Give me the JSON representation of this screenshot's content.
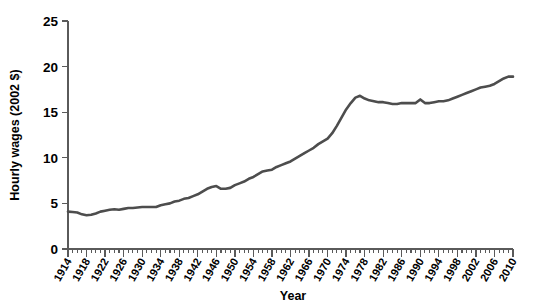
{
  "chart_data": {
    "type": "line",
    "title": "",
    "xlabel": "Year",
    "ylabel": "Hourly wages (2002 $)",
    "xlim": [
      1914,
      2010
    ],
    "ylim": [
      0,
      25
    ],
    "grid": false,
    "legend": null,
    "line_color": "#4d4d4d",
    "axis_color": "#5a5a5a",
    "y_ticks": [
      0,
      5,
      10,
      15,
      20,
      25
    ],
    "x_ticks": [
      1914,
      1918,
      1922,
      1926,
      1930,
      1934,
      1938,
      1942,
      1946,
      1950,
      1954,
      1958,
      1962,
      1966,
      1970,
      1974,
      1978,
      1982,
      1986,
      1990,
      1994,
      1998,
      2002,
      2006,
      2010
    ],
    "x_minor_step": 1,
    "series": [
      {
        "name": "Hourly wages (2002 $)",
        "x": [
          1914,
          1915,
          1916,
          1917,
          1918,
          1919,
          1920,
          1921,
          1922,
          1923,
          1924,
          1925,
          1926,
          1927,
          1928,
          1929,
          1930,
          1931,
          1932,
          1933,
          1934,
          1935,
          1936,
          1937,
          1938,
          1939,
          1940,
          1941,
          1942,
          1943,
          1944,
          1945,
          1946,
          1947,
          1948,
          1949,
          1950,
          1951,
          1952,
          1953,
          1954,
          1955,
          1956,
          1957,
          1958,
          1959,
          1960,
          1961,
          1962,
          1963,
          1964,
          1965,
          1966,
          1967,
          1968,
          1969,
          1970,
          1971,
          1972,
          1973,
          1974,
          1975,
          1976,
          1977,
          1978,
          1979,
          1980,
          1981,
          1982,
          1983,
          1984,
          1985,
          1986,
          1987,
          1988,
          1989,
          1990,
          1991,
          1992,
          1993,
          1994,
          1995,
          1996,
          1997,
          1998,
          1999,
          2000,
          2001,
          2002,
          2003,
          2004,
          2005,
          2006,
          2007,
          2008,
          2009,
          2010
        ],
        "y": [
          4.1,
          4.05,
          4.0,
          3.8,
          3.7,
          3.75,
          3.9,
          4.1,
          4.2,
          4.3,
          4.35,
          4.3,
          4.4,
          4.5,
          4.5,
          4.55,
          4.6,
          4.6,
          4.6,
          4.6,
          4.8,
          4.9,
          5.0,
          5.2,
          5.3,
          5.5,
          5.6,
          5.8,
          6.0,
          6.3,
          6.6,
          6.8,
          6.9,
          6.6,
          6.6,
          6.7,
          7.0,
          7.2,
          7.4,
          7.7,
          7.9,
          8.2,
          8.5,
          8.6,
          8.7,
          9.0,
          9.2,
          9.4,
          9.6,
          9.9,
          10.2,
          10.5,
          10.8,
          11.1,
          11.5,
          11.8,
          12.1,
          12.7,
          13.5,
          14.4,
          15.3,
          16.0,
          16.6,
          16.8,
          16.5,
          16.3,
          16.2,
          16.1,
          16.1,
          16.0,
          15.9,
          15.9,
          16.0,
          16.0,
          16.0,
          16.0,
          16.4,
          16.0,
          16.0,
          16.1,
          16.2,
          16.2,
          16.3,
          16.5,
          16.7,
          16.9,
          17.1,
          17.3,
          17.5,
          17.7,
          17.8,
          17.9,
          18.1,
          18.4,
          18.7,
          18.9,
          18.9
        ]
      }
    ]
  }
}
